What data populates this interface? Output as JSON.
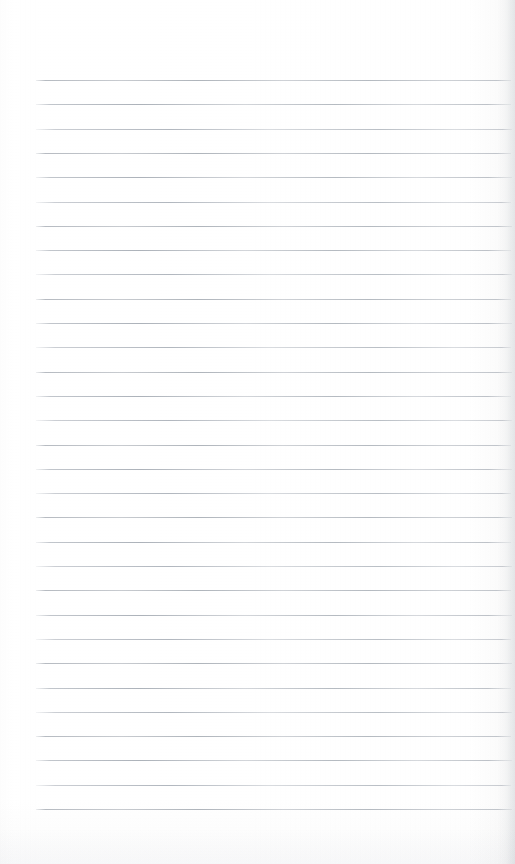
{
  "document": {
    "kind": "lined-notebook-paper",
    "description": "Blank ruled notebook page",
    "page_width": 515,
    "page_height": 864,
    "text_content": "",
    "written_content": "",
    "heading": "",
    "page_number": ""
  },
  "paper": {
    "background_color": "#ffffff",
    "rule_color": "#b4b9c0",
    "rule_color_light": "#cdd1d6",
    "edge_shadow_color": "#afb4ba",
    "margin_color": "#ffffff"
  },
  "ruling": {
    "line_count": 31,
    "first_line_y": 80,
    "line_spacing": 24.3,
    "line_thickness": 1,
    "line_left_x": 36,
    "line_right_x": 512,
    "top_margin": 80,
    "bottom_margin": 54,
    "has_vertical_margin_rule": false,
    "lines": [
      {
        "index": 1,
        "y": 80,
        "left": 36,
        "right": 511
      },
      {
        "index": 2,
        "y": 104.3,
        "left": 36,
        "right": 511
      },
      {
        "index": 3,
        "y": 128.6,
        "left": 36,
        "right": 512
      },
      {
        "index": 4,
        "y": 152.9,
        "left": 36,
        "right": 511
      },
      {
        "index": 5,
        "y": 177.2,
        "left": 36,
        "right": 512
      },
      {
        "index": 6,
        "y": 201.5,
        "left": 36,
        "right": 511
      },
      {
        "index": 7,
        "y": 225.8,
        "left": 36,
        "right": 512
      },
      {
        "index": 8,
        "y": 250.1,
        "left": 36,
        "right": 511
      },
      {
        "index": 9,
        "y": 274.4,
        "left": 36,
        "right": 512
      },
      {
        "index": 10,
        "y": 298.7,
        "left": 36,
        "right": 511
      },
      {
        "index": 11,
        "y": 323.0,
        "left": 36,
        "right": 512
      },
      {
        "index": 12,
        "y": 347.3,
        "left": 36,
        "right": 511
      },
      {
        "index": 13,
        "y": 371.6,
        "left": 36,
        "right": 512
      },
      {
        "index": 14,
        "y": 395.9,
        "left": 36,
        "right": 511
      },
      {
        "index": 15,
        "y": 420.2,
        "left": 36,
        "right": 512
      },
      {
        "index": 16,
        "y": 444.5,
        "left": 36,
        "right": 511
      },
      {
        "index": 17,
        "y": 468.8,
        "left": 36,
        "right": 512
      },
      {
        "index": 18,
        "y": 493.1,
        "left": 36,
        "right": 511
      },
      {
        "index": 19,
        "y": 517.4,
        "left": 36,
        "right": 512
      },
      {
        "index": 20,
        "y": 541.7,
        "left": 36,
        "right": 511
      },
      {
        "index": 21,
        "y": 566.0,
        "left": 36,
        "right": 512
      },
      {
        "index": 22,
        "y": 590.3,
        "left": 36,
        "right": 511
      },
      {
        "index": 23,
        "y": 614.6,
        "left": 36,
        "right": 512
      },
      {
        "index": 24,
        "y": 638.9,
        "left": 36,
        "right": 511
      },
      {
        "index": 25,
        "y": 663.2,
        "left": 36,
        "right": 512
      },
      {
        "index": 26,
        "y": 687.5,
        "left": 36,
        "right": 511
      },
      {
        "index": 27,
        "y": 711.8,
        "left": 36,
        "right": 512
      },
      {
        "index": 28,
        "y": 736.1,
        "left": 36,
        "right": 511
      },
      {
        "index": 29,
        "y": 760.4,
        "left": 36,
        "right": 512
      },
      {
        "index": 30,
        "y": 784.7,
        "left": 36,
        "right": 511
      },
      {
        "index": 31,
        "y": 809.0,
        "left": 36,
        "right": 512
      }
    ]
  }
}
